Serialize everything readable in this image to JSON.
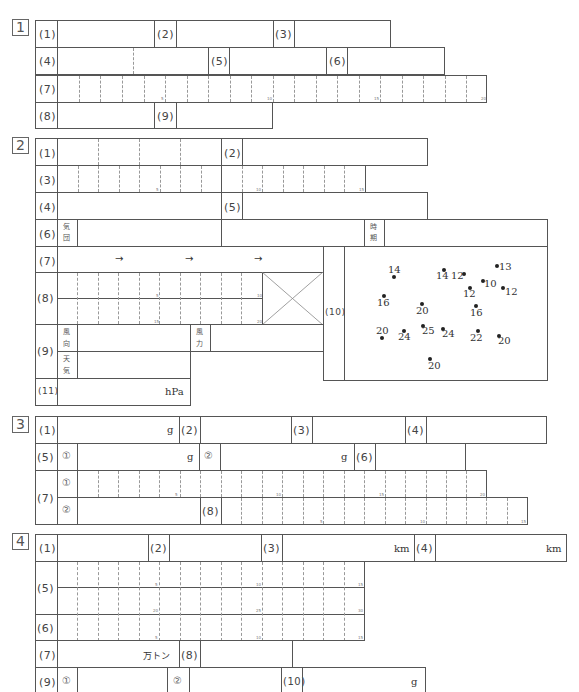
{
  "sections": {
    "s1": {
      "num": "1",
      "labels": {
        "q1": "(1)",
        "q2": "(2)",
        "q3": "(3)",
        "q4": "(4)",
        "q5": "(5)",
        "q6": "(6)",
        "q7": "(7)",
        "q8": "(8)",
        "q9": "(9)"
      },
      "q7_marks": {
        "m5": "5",
        "m10": "10",
        "m15": "15",
        "m20": "20"
      }
    },
    "s2": {
      "num": "2",
      "labels": {
        "q1": "(1)",
        "q2": "(2)",
        "q3": "(3)",
        "q4": "(4)",
        "q5": "(5)",
        "q6": "(6)",
        "q7": "(7)",
        "q8": "(8)",
        "q9": "(9)",
        "q10": "(10)",
        "q11": "(11)"
      },
      "q3_marks": {
        "m5": "5",
        "m10": "10",
        "m15": "15"
      },
      "q8_marks": {
        "m5": "5",
        "m10": "10",
        "m15": "15",
        "m20": "20"
      },
      "q6_front": [
        "気",
        "団"
      ],
      "q6_time": [
        "時",
        "期"
      ],
      "q7_arrow": "→",
      "q9_wind_dir": [
        "風",
        "向"
      ],
      "q9_weather": [
        "天",
        "気"
      ],
      "q9_wind_force": [
        "風",
        "力"
      ],
      "q11_unit": "hPa",
      "map_points": [
        {
          "value": "14",
          "x": 393,
          "y": 277
        },
        {
          "value": "14",
          "x": 443,
          "y": 270
        },
        {
          "value": "12",
          "x": 463,
          "y": 274
        },
        {
          "value": "13",
          "x": 496,
          "y": 265
        },
        {
          "value": "10",
          "x": 482,
          "y": 279
        },
        {
          "value": "12",
          "x": 468,
          "y": 287
        },
        {
          "value": "12",
          "x": 502,
          "y": 287
        },
        {
          "value": "16",
          "x": 383,
          "y": 295
        },
        {
          "value": "20",
          "x": 421,
          "y": 303
        },
        {
          "value": "16",
          "x": 475,
          "y": 305
        },
        {
          "value": "20",
          "x": 381,
          "y": 337
        },
        {
          "value": "24",
          "x": 403,
          "y": 330
        },
        {
          "value": "25",
          "x": 422,
          "y": 325
        },
        {
          "value": "24",
          "x": 442,
          "y": 328
        },
        {
          "value": "22",
          "x": 477,
          "y": 330
        },
        {
          "value": "20",
          "x": 498,
          "y": 335
        },
        {
          "value": "20",
          "x": 429,
          "y": 358
        }
      ]
    },
    "s3": {
      "num": "3",
      "labels": {
        "q1": "(1)",
        "q2": "(2)",
        "q3": "(3)",
        "q4": "(4)",
        "q5": "(5)",
        "q6": "(6)",
        "q7": "(7)",
        "q8": "(8)"
      },
      "circ1": "①",
      "circ2": "②",
      "unit_g": "g",
      "q7_marks": {
        "m5": "5",
        "m10": "10",
        "m15": "15",
        "m20": "20"
      },
      "q8_marks": {
        "m5": "5",
        "m10": "10",
        "m15": "15"
      }
    },
    "s4": {
      "num": "4",
      "labels": {
        "q1": "(1)",
        "q2": "(2)",
        "q3": "(3)",
        "q4": "(4)",
        "q5": "(5)",
        "q6": "(6)",
        "q7": "(7)",
        "q8": "(8)",
        "q9": "(9)",
        "q10": "(10)"
      },
      "unit_km": "km",
      "unit_g": "g",
      "unit_man_ton": "万トン",
      "circ1": "①",
      "circ2": "②",
      "q5_marks": {
        "m5": "5",
        "m10": "10",
        "m15": "15",
        "m20": "20",
        "m25": "25",
        "m30": "30"
      },
      "q6_marks": {
        "m5": "5",
        "m10": "10",
        "m15": "15"
      }
    }
  }
}
